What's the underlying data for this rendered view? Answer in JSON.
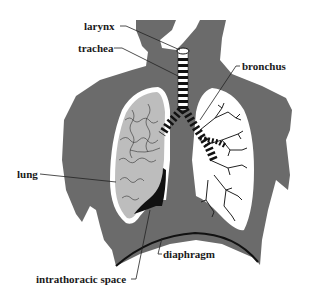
{
  "diagram": {
    "type": "anatomical-illustration",
    "colors": {
      "background": "#ffffff",
      "body_silhouette": "#6b6b6b",
      "left_lung_fill": "#bdbdbd",
      "right_lung_fill": "#ffffff",
      "lung_outline": "#ffffff",
      "intrathoracic_space": "#111111",
      "diaphragm_line": "#111111",
      "label_text": "#1a1a1a",
      "leader_lines": "#222222"
    },
    "labels": {
      "larynx": "larynx",
      "trachea": "trachea",
      "bronchus": "bronchus",
      "lung": "lung",
      "diaphragm": "diaphragm",
      "intrathoracic_space": "intrathoracic space"
    }
  }
}
